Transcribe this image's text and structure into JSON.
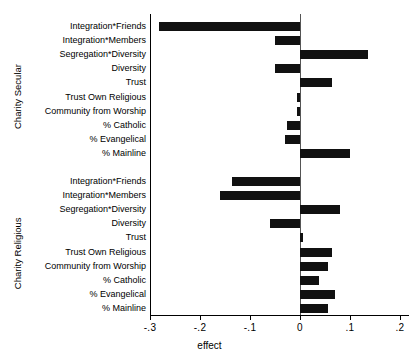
{
  "chart_data": {
    "type": "bar",
    "orientation": "horizontal",
    "title": "",
    "xlabel": "effect",
    "ylabel": "",
    "xlim": [
      -0.3,
      0.218
    ],
    "xticks": [
      -0.3,
      -0.2,
      -0.1,
      0,
      0.1,
      0.2
    ],
    "xtick_labels": [
      "-.3",
      "-.2",
      "-.1",
      "0",
      ".1",
      ".2"
    ],
    "grid": false,
    "legend": null,
    "zero_reference_line": 0,
    "groups": [
      {
        "name": "Charity Secular",
        "categories": [
          "Integration*Friends",
          "Integration*Members",
          "Segregation*Diversity",
          "Diversity",
          "Trust",
          "Trust Own Religious",
          "Community from Worship",
          "% Catholic",
          "% Evangelical",
          "% Mainline"
        ],
        "values": [
          -0.282,
          -0.05,
          0.136,
          -0.05,
          0.064,
          -0.006,
          -0.006,
          -0.026,
          -0.03,
          0.1
        ]
      },
      {
        "name": "Charity Religious",
        "categories": [
          "Integration*Friends",
          "Integration*Members",
          "Segregation*Diversity",
          "Diversity",
          "Trust",
          "Trust Own Religious",
          "Community from Worship",
          "% Catholic",
          "% Evangelical",
          "% Mainline"
        ],
        "values": [
          -0.136,
          -0.16,
          0.08,
          -0.06,
          0.006,
          0.064,
          0.055,
          0.038,
          0.07,
          0.055
        ]
      }
    ],
    "bar_color": "#111111"
  }
}
